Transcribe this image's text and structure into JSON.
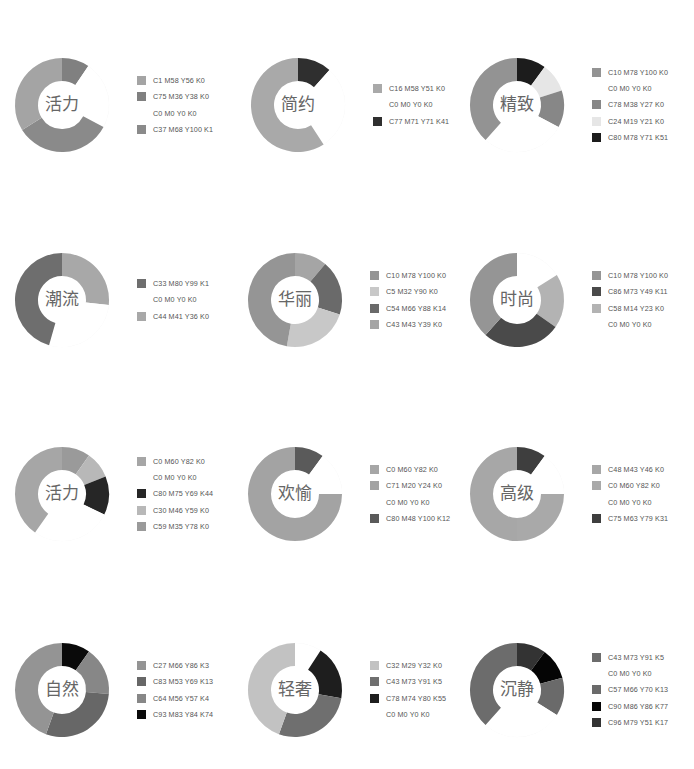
{
  "chart_data": [
    {
      "type": "pie",
      "title": "活力",
      "cx": 62,
      "cy": 105,
      "legend": [
        {
          "label": "C1 M58 Y56 K0",
          "color": "#a4a4a4"
        },
        {
          "label": "C75 M36 Y38 K0",
          "color": "#808080"
        },
        {
          "label": "C0  M0  Y0  K0",
          "color": "#ffffff"
        },
        {
          "label": "C37  M68  Y100  K1",
          "color": "#8a8a8a"
        }
      ],
      "slices": [
        {
          "legend": 1,
          "start": 0,
          "end": 34
        },
        {
          "legend": 2,
          "start": 34,
          "end": 118
        },
        {
          "legend": 3,
          "start": 118,
          "end": 238
        },
        {
          "legend": 0,
          "start": 238,
          "end": 360
        }
      ],
      "values": [
        34,
        23,
        33,
        34
      ]
    },
    {
      "type": "pie",
      "title": "简约",
      "cx": 298,
      "cy": 105,
      "legend": [
        {
          "label": "C16 M58 Y51 K0",
          "color": "#a9a9a9"
        },
        {
          "label": "C0  M0  Y0  K0",
          "color": "#ffffff"
        },
        {
          "label": "C77 M71 Y71 K41",
          "color": "#2f2f2f"
        }
      ],
      "slices": [
        {
          "legend": 2,
          "start": 0,
          "end": 42
        },
        {
          "legend": 1,
          "start": 42,
          "end": 147
        },
        {
          "legend": 0,
          "start": 147,
          "end": 360
        }
      ],
      "values": [
        59,
        29,
        12
      ]
    },
    {
      "type": "pie",
      "title": "精致",
      "cx": 517,
      "cy": 105,
      "legend": [
        {
          "label": "C10 M78 Y100 K0",
          "color": "#939393"
        },
        {
          "label": "C0  M0  Y0  K0",
          "color": "#ffffff"
        },
        {
          "label": "C78 M38 Y27 K0",
          "color": "#878787"
        },
        {
          "label": "C24 M19 Y21 K0",
          "color": "#e6e6e6"
        },
        {
          "label": "C80 M78 Y71 K51",
          "color": "#1c1c1c"
        }
      ],
      "slices": [
        {
          "legend": 4,
          "start": 0,
          "end": 36
        },
        {
          "legend": 3,
          "start": 36,
          "end": 72
        },
        {
          "legend": 2,
          "start": 72,
          "end": 118
        },
        {
          "legend": 1,
          "start": 118,
          "end": 222
        },
        {
          "legend": 0,
          "start": 222,
          "end": 360
        }
      ],
      "values": [
        38,
        29,
        13,
        10,
        10
      ]
    },
    {
      "type": "pie",
      "title": "潮流",
      "cx": 62,
      "cy": 300,
      "legend": [
        {
          "label": "C33 M80 Y99 K1",
          "color": "#6e6e6e"
        },
        {
          "label": "C0  M0  Y0  K0",
          "color": "#ffffff"
        },
        {
          "label": "C44 M41 Y36 K0",
          "color": "#a8a8a8"
        }
      ],
      "slices": [
        {
          "legend": 2,
          "start": 0,
          "end": 96
        },
        {
          "legend": 1,
          "start": 96,
          "end": 196
        },
        {
          "legend": 0,
          "start": 196,
          "end": 360
        }
      ],
      "values": [
        46,
        28,
        26
      ]
    },
    {
      "type": "pie",
      "title": "华丽",
      "cx": 295,
      "cy": 300,
      "legend": [
        {
          "label": "C10 M78 Y100 K0",
          "color": "#959595"
        },
        {
          "label": "C5 M32 Y90 K0",
          "color": "#c8c8c8"
        },
        {
          "label": "C54 M66 Y88 K14",
          "color": "#6a6a6a"
        },
        {
          "label": "C43 M43 Y39 K0",
          "color": "#a5a5a5"
        }
      ],
      "slices": [
        {
          "legend": 3,
          "start": 0,
          "end": 40
        },
        {
          "legend": 2,
          "start": 40,
          "end": 108
        },
        {
          "legend": 1,
          "start": 108,
          "end": 190
        },
        {
          "legend": 0,
          "start": 190,
          "end": 360
        }
      ],
      "values": [
        47,
        23,
        19,
        11
      ]
    },
    {
      "type": "pie",
      "title": "时尚",
      "cx": 517,
      "cy": 300,
      "legend": [
        {
          "label": "C10 M78 Y100 K0",
          "color": "#959595"
        },
        {
          "label": "C86 M73 Y49 K11",
          "color": "#4a4a4a"
        },
        {
          "label": "C58 M14 Y23 K0",
          "color": "#b3b3b3"
        },
        {
          "label": "C0  M0  Y0  K0",
          "color": "#ffffff"
        }
      ],
      "slices": [
        {
          "legend": 3,
          "start": 0,
          "end": 58
        },
        {
          "legend": 2,
          "start": 58,
          "end": 125
        },
        {
          "legend": 1,
          "start": 125,
          "end": 222
        },
        {
          "legend": 0,
          "start": 222,
          "end": 360
        }
      ],
      "values": [
        38,
        27,
        19,
        16
      ]
    },
    {
      "type": "pie",
      "title": "活力",
      "cx": 62,
      "cy": 494,
      "legend": [
        {
          "label": "C0 M60 Y82 K0",
          "color": "#a6a6a6"
        },
        {
          "label": "C0  M0  Y0  K0",
          "color": "#ffffff"
        },
        {
          "label": "C80 M75 Y69 K44",
          "color": "#262626"
        },
        {
          "label": "C30 M46 Y59 K0",
          "color": "#b8b8b8"
        },
        {
          "label": "C59 M35 Y78 K0",
          "color": "#9a9a9a"
        }
      ],
      "slices": [
        {
          "legend": 4,
          "start": 0,
          "end": 35
        },
        {
          "legend": 3,
          "start": 35,
          "end": 68
        },
        {
          "legend": 2,
          "start": 68,
          "end": 116
        },
        {
          "legend": 1,
          "start": 116,
          "end": 215
        },
        {
          "legend": 0,
          "start": 215,
          "end": 360
        }
      ],
      "values": [
        40,
        28,
        13,
        9,
        10
      ]
    },
    {
      "type": "pie",
      "title": "欢愉",
      "cx": 295,
      "cy": 494,
      "legend": [
        {
          "label": "C0 M60 Y82 K0",
          "color": "#a6a6a6"
        },
        {
          "label": "C71 M20 Y24 K0",
          "color": "#a3a3a3"
        },
        {
          "label": "C0  M0  Y0  K0",
          "color": "#ffffff"
        },
        {
          "label": "C80 M48 Y100 K12",
          "color": "#5a5a5a"
        }
      ],
      "slices": [
        {
          "legend": 3,
          "start": 0,
          "end": 36
        },
        {
          "legend": 2,
          "start": 36,
          "end": 90
        },
        {
          "legend": 1,
          "start": 90,
          "end": 360
        }
      ],
      "values": [
        75,
        15,
        10
      ]
    },
    {
      "type": "pie",
      "title": "高级",
      "cx": 517,
      "cy": 494,
      "legend": [
        {
          "label": "C48 M43 Y46 K0",
          "color": "#a7a7a7"
        },
        {
          "label": "C0 M60 Y82 K0",
          "color": "#a9a9a9"
        },
        {
          "label": "C0  M0  Y0  K0",
          "color": "#ffffff"
        },
        {
          "label": "C75 M63 Y79 K31",
          "color": "#3e3e3e"
        }
      ],
      "slices": [
        {
          "legend": 3,
          "start": 0,
          "end": 36
        },
        {
          "legend": 2,
          "start": 36,
          "end": 90
        },
        {
          "legend": 1,
          "start": 90,
          "end": 180
        },
        {
          "legend": 0,
          "start": 180,
          "end": 360
        }
      ],
      "values": [
        50,
        25,
        15,
        10
      ]
    },
    {
      "type": "pie",
      "title": "自然",
      "cx": 62,
      "cy": 690,
      "legend": [
        {
          "label": "C27 M66 Y86 K3",
          "color": "#949494"
        },
        {
          "label": "C83 M53 Y69 K13",
          "color": "#676767"
        },
        {
          "label": "C64 M56 Y57 K4",
          "color": "#878787"
        },
        {
          "label": "C93 M83 Y84 K74",
          "color": "#0a0a0a"
        }
      ],
      "slices": [
        {
          "legend": 3,
          "start": 0,
          "end": 35
        },
        {
          "legend": 2,
          "start": 35,
          "end": 95
        },
        {
          "legend": 1,
          "start": 95,
          "end": 200
        },
        {
          "legend": 0,
          "start": 200,
          "end": 360
        }
      ],
      "values": [
        44,
        29,
        17,
        10
      ]
    },
    {
      "type": "pie",
      "title": "轻奢",
      "cx": 295,
      "cy": 690,
      "legend": [
        {
          "label": "C32 M29 Y32 K0",
          "color": "#c2c2c2"
        },
        {
          "label": "C43 M73 Y91 K5",
          "color": "#6f6f6f"
        },
        {
          "label": "C78 M74 Y80 K55",
          "color": "#1e1e1e"
        },
        {
          "label": "C0  M0  Y0  K0",
          "color": "#ffffff"
        }
      ],
      "slices": [
        {
          "legend": 3,
          "start": 0,
          "end": 33
        },
        {
          "legend": 2,
          "start": 33,
          "end": 100
        },
        {
          "legend": 1,
          "start": 100,
          "end": 200
        },
        {
          "legend": 0,
          "start": 200,
          "end": 360
        }
      ],
      "values": [
        44,
        28,
        19,
        9
      ]
    },
    {
      "type": "pie",
      "title": "沉静",
      "cx": 517,
      "cy": 690,
      "legend": [
        {
          "label": "C43 M73 Y91 K5",
          "color": "#6c6c6c"
        },
        {
          "label": "C0  M0  Y0  K0",
          "color": "#ffffff"
        },
        {
          "label": "C57 M66 Y70 K13",
          "color": "#6a6a6a"
        },
        {
          "label": "C90 M86 Y86 K77",
          "color": "#050505"
        },
        {
          "label": "C96 M79 Y51 K17",
          "color": "#333333"
        }
      ],
      "slices": [
        {
          "legend": 4,
          "start": 0,
          "end": 36
        },
        {
          "legend": 3,
          "start": 36,
          "end": 75
        },
        {
          "legend": 2,
          "start": 75,
          "end": 122
        },
        {
          "legend": 1,
          "start": 122,
          "end": 222
        },
        {
          "legend": 0,
          "start": 222,
          "end": 360
        }
      ],
      "values": [
        38,
        28,
        13,
        11,
        10
      ]
    }
  ]
}
